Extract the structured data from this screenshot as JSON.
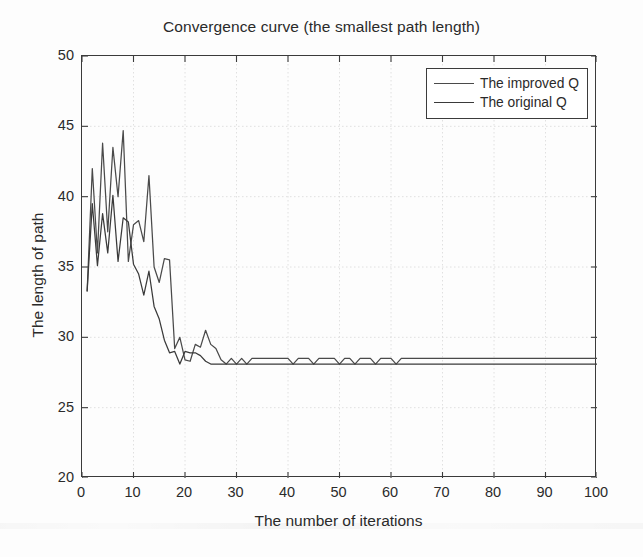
{
  "chart_data": {
    "type": "line",
    "title": "Convergence curve (the smallest path length)",
    "xlabel": "The number of iterations",
    "ylabel": "The length of path",
    "xlim": [
      0,
      100
    ],
    "ylim": [
      20,
      50
    ],
    "xticks": [
      0,
      10,
      20,
      30,
      40,
      50,
      60,
      70,
      80,
      90,
      100
    ],
    "yticks": [
      20,
      25,
      30,
      35,
      40,
      45,
      50
    ],
    "grid": true,
    "legend_position": "top-right",
    "series": [
      {
        "name": "The improved Q",
        "color": "#4a4a4a",
        "x": [
          1,
          2,
          3,
          4,
          5,
          6,
          7,
          8,
          9,
          10,
          11,
          12,
          13,
          14,
          15,
          16,
          17,
          18,
          19,
          20,
          21,
          22,
          23,
          24,
          25,
          26,
          27,
          28,
          29,
          30,
          31,
          32,
          33,
          34,
          35,
          36,
          37,
          38,
          39,
          40,
          41,
          42,
          43,
          44,
          45,
          46,
          47,
          48,
          49,
          50,
          51,
          52,
          53,
          54,
          55,
          56,
          57,
          58,
          59,
          60,
          61,
          62,
          63,
          64,
          65,
          66,
          67,
          68,
          69,
          70,
          71,
          72,
          73,
          74,
          75,
          76,
          77,
          78,
          79,
          80,
          81,
          82,
          83,
          84,
          85,
          86,
          87,
          88,
          89,
          90,
          91,
          92,
          93,
          94,
          95,
          96,
          97,
          98,
          99,
          100
        ],
        "values": [
          33.3,
          42.0,
          36.0,
          43.8,
          37.5,
          43.5,
          40.0,
          44.7,
          35.4,
          38.0,
          38.3,
          36.8,
          41.5,
          35.0,
          33.9,
          35.6,
          35.5,
          29.2,
          30.0,
          28.4,
          28.3,
          29.5,
          29.3,
          30.5,
          29.5,
          29.2,
          28.4,
          28.1,
          28.5,
          28.1,
          28.5,
          28.1,
          28.5,
          28.5,
          28.5,
          28.5,
          28.5,
          28.5,
          28.5,
          28.5,
          28.1,
          28.5,
          28.5,
          28.5,
          28.1,
          28.5,
          28.5,
          28.5,
          28.5,
          28.1,
          28.5,
          28.5,
          28.1,
          28.5,
          28.5,
          28.5,
          28.1,
          28.5,
          28.5,
          28.5,
          28.1,
          28.5,
          28.5,
          28.5,
          28.5,
          28.5,
          28.5,
          28.5,
          28.5,
          28.5,
          28.5,
          28.5,
          28.5,
          28.5,
          28.5,
          28.5,
          28.5,
          28.5,
          28.5,
          28.5,
          28.5,
          28.5,
          28.5,
          28.5,
          28.5,
          28.5,
          28.5,
          28.5,
          28.5,
          28.5,
          28.5,
          28.5,
          28.5,
          28.5,
          28.5,
          28.5,
          28.5,
          28.5,
          28.5,
          28.5
        ]
      },
      {
        "name": "The original Q",
        "color": "#3a3a3a",
        "x": [
          1,
          2,
          3,
          4,
          5,
          6,
          7,
          8,
          9,
          10,
          11,
          12,
          13,
          14,
          15,
          16,
          17,
          18,
          19,
          20,
          21,
          22,
          23,
          24,
          25,
          26,
          27,
          28,
          29,
          30,
          31,
          32,
          33,
          34,
          35,
          36,
          37,
          38,
          39,
          40,
          41,
          42,
          43,
          44,
          45,
          46,
          47,
          48,
          49,
          50,
          51,
          52,
          53,
          54,
          55,
          56,
          57,
          58,
          59,
          60,
          61,
          62,
          63,
          64,
          65,
          66,
          67,
          68,
          69,
          70,
          71,
          72,
          73,
          74,
          75,
          76,
          77,
          78,
          79,
          80,
          81,
          82,
          83,
          84,
          85,
          86,
          87,
          88,
          89,
          90,
          91,
          92,
          93,
          94,
          95,
          96,
          97,
          98,
          99,
          100
        ],
        "values": [
          33.3,
          39.5,
          35.1,
          38.8,
          36.0,
          40.1,
          35.4,
          38.5,
          38.2,
          35.2,
          34.5,
          33.0,
          34.7,
          32.2,
          31.3,
          29.8,
          28.9,
          29.0,
          28.1,
          29.0,
          28.9,
          28.9,
          28.7,
          28.3,
          28.1,
          28.1,
          28.1,
          28.1,
          28.1,
          28.1,
          28.1,
          28.1,
          28.1,
          28.1,
          28.1,
          28.1,
          28.1,
          28.1,
          28.1,
          28.1,
          28.1,
          28.1,
          28.1,
          28.1,
          28.1,
          28.1,
          28.1,
          28.1,
          28.1,
          28.1,
          28.1,
          28.1,
          28.1,
          28.1,
          28.1,
          28.1,
          28.1,
          28.1,
          28.1,
          28.1,
          28.1,
          28.1,
          28.1,
          28.1,
          28.1,
          28.1,
          28.1,
          28.1,
          28.1,
          28.1,
          28.1,
          28.1,
          28.1,
          28.1,
          28.1,
          28.1,
          28.1,
          28.1,
          28.1,
          28.1,
          28.1,
          28.1,
          28.1,
          28.1,
          28.1,
          28.1,
          28.1,
          28.1,
          28.1,
          28.1,
          28.1,
          28.1,
          28.1,
          28.1,
          28.1,
          28.1,
          28.1,
          28.1,
          28.1,
          28.1
        ]
      }
    ]
  },
  "legend": {
    "entries": [
      {
        "label": "The improved Q"
      },
      {
        "label": "The original Q"
      }
    ]
  },
  "axis_colors": {
    "frame": "#3b3b3b",
    "grid": "#d8d8d8",
    "text": "#2a2a2a"
  }
}
